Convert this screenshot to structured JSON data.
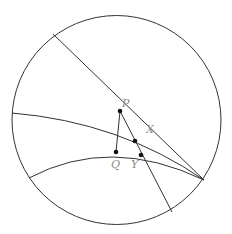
{
  "diagram": {
    "type": "geometry",
    "labels": {
      "P": "P",
      "Q": "Q",
      "X": "X",
      "Y": "Y"
    },
    "colors": {
      "stroke": "#333333",
      "label": "#8a8a8a",
      "background": "#ffffff"
    }
  }
}
